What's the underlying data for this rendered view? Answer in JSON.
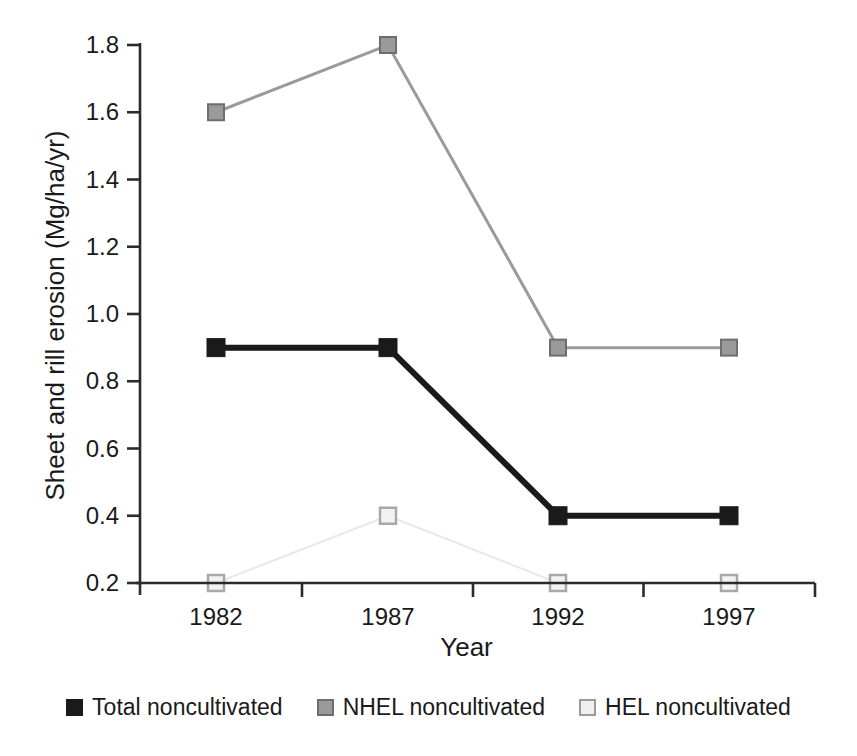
{
  "chart_data": {
    "type": "line",
    "title": "",
    "xlabel": "Year",
    "ylabel": "Sheet and rill erosion (Mg/ha/yr)",
    "categories": [
      "1982",
      "1987",
      "1992",
      "1997"
    ],
    "x": [
      1982,
      1987,
      1992,
      1997
    ],
    "xlim": [
      1980.5,
      1999.5
    ],
    "ylim": [
      0.2,
      1.8
    ],
    "yticks": [
      "1.8",
      "1.6",
      "1.4",
      "1.2",
      "1.0",
      "0.8",
      "0.6",
      "0.4",
      "0.2"
    ],
    "ytick_values": [
      1.8,
      1.6,
      1.4,
      1.2,
      1.0,
      0.8,
      0.6,
      0.4,
      0.2
    ],
    "xticks": [
      "1982",
      "1987",
      "1992",
      "1997"
    ],
    "grid": false,
    "legend_position": "bottom",
    "series": [
      {
        "name": "Total noncultivated",
        "values": [
          0.9,
          0.9,
          0.4,
          0.4
        ],
        "color": "#1a1a1a",
        "marker": "square-filled",
        "line_width": 6
      },
      {
        "name": "NHEL noncultivated",
        "values": [
          1.6,
          1.8,
          0.9,
          0.9
        ],
        "color": "#9a9a9a",
        "marker": "square-filled",
        "line_width": 3
      },
      {
        "name": "HEL noncultivated",
        "values": [
          0.2,
          0.4,
          0.2,
          0.2
        ],
        "color": "#e8e8e8",
        "marker": "square-open",
        "line_width": 2
      }
    ]
  },
  "axis": {
    "line_color": "#2b2b2b"
  },
  "legend": {
    "items": [
      {
        "label": "Total noncultivated",
        "swatch": "#1a1a1a",
        "border": "#1a1a1a"
      },
      {
        "label": "NHEL noncultivated",
        "swatch": "#9a9a9a",
        "border": "#6e6e6e"
      },
      {
        "label": "HEL noncultivated",
        "swatch": "#f0f0f0",
        "border": "#9a9a9a"
      }
    ]
  }
}
